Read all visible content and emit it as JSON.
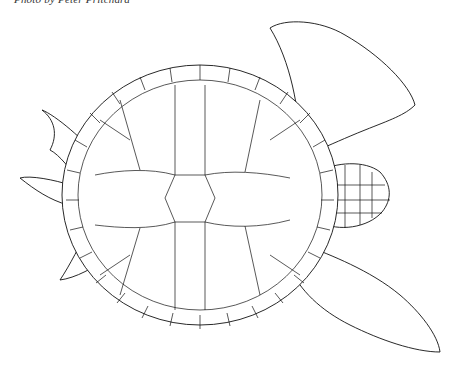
{
  "caption": "Photo by Peter Pritchard",
  "figure": {
    "colors": {
      "line": "#111111",
      "background": "#ffffff"
    }
  }
}
